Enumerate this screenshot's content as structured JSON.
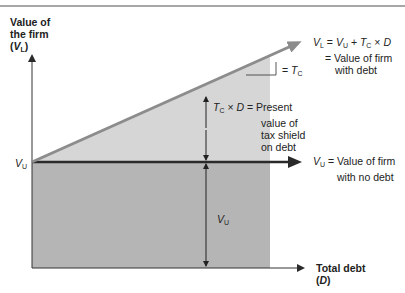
{
  "diagram": {
    "y_axis": {
      "line1": "Value of",
      "line2": "the firm",
      "symbol_open": "(",
      "symbol": "V",
      "symbol_sub": "L",
      "symbol_close": ")"
    },
    "x_axis": {
      "line1": "Total debt",
      "symbol_open": "(",
      "symbol": "D",
      "symbol_close": ")"
    },
    "intercept_label": {
      "symbol": "V",
      "sub": "U"
    },
    "levered_line": {
      "eq_v": "V",
      "eq_v_sub": "L",
      "eq_mid1": " = ",
      "eq_vu": "V",
      "eq_vu_sub": "U",
      "eq_mid2": " + ",
      "eq_t": "T",
      "eq_t_sub": "C",
      "eq_mid3": " × ",
      "eq_d": "D",
      "desc_line1": "= Value of firm",
      "desc_line2": "with debt"
    },
    "slope_label": {
      "prefix": "= ",
      "symbol": "T",
      "sub": "C"
    },
    "tax_shield": {
      "t": "T",
      "t_sub": "C",
      "times": " × ",
      "d": "D",
      "eq": " = ",
      "line1": "Present",
      "line2": "value of",
      "line3": "tax shield",
      "line4": "on debt"
    },
    "unlevered_line": {
      "symbol": "V",
      "sub": "U",
      "line1": " = Value of firm",
      "line2": "with no debt"
    },
    "vu_region_label": {
      "symbol": "V",
      "sub": "U"
    },
    "colors": {
      "rule": "#8a8a8a",
      "lower_fill": "#b5b5b5",
      "upper_fill": "#d6d6d6",
      "levered_line": "#8c8c8c",
      "unlevered_line": "#2a2a2a",
      "axis": "#333333"
    }
  }
}
